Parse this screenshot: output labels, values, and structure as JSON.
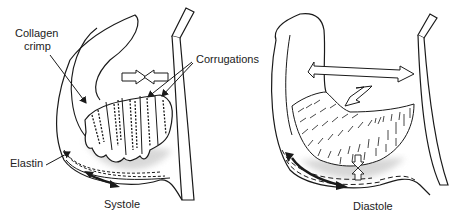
{
  "panels": [
    {
      "id": "systole",
      "caption": "Systole",
      "labels": {
        "collagen_crimp_line1": "Collagen",
        "collagen_crimp_line2": "crimp",
        "corrugations": "Corrugations",
        "elastin": "Elastin"
      },
      "icons": [
        "compression-arrows-icon",
        "bidirectional-arrow-icon"
      ]
    },
    {
      "id": "diastole",
      "caption": "Diastole",
      "icons": [
        "horizontal-stretch-arrow-icon",
        "diagonal-bidirectional-arrow-icon",
        "vertical-compression-arrows-icon",
        "curved-bidirectional-arrow-icon"
      ]
    }
  ],
  "colors": {
    "line": "#1a1a1a",
    "shadow": "#c8c8c8",
    "background": "#ffffff"
  }
}
